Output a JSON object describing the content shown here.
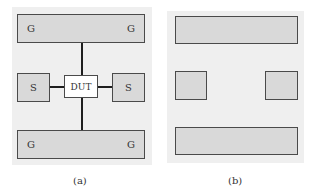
{
  "figure": {
    "panels": [
      {
        "id": "a",
        "caption": "(a)",
        "top_bar": {
          "left_label": "G",
          "right_label": "G"
        },
        "left_pad": {
          "label": "S"
        },
        "center_device": {
          "label": "DUT"
        },
        "right_pad": {
          "label": "S"
        },
        "bottom_bar": {
          "left_label": "G",
          "right_label": "G"
        }
      },
      {
        "id": "b",
        "caption": "(b)",
        "top_bar": {
          "label": ""
        },
        "left_pad": {
          "label": ""
        },
        "right_pad": {
          "label": ""
        },
        "bottom_bar": {
          "label": ""
        }
      }
    ],
    "colors": {
      "panel_background": "#efefef",
      "pad_fill": "#d9d9d9",
      "pad_border": "#4a4a4a",
      "dut_fill": "#ffffff",
      "connector_line": "#1e1e1e"
    }
  }
}
